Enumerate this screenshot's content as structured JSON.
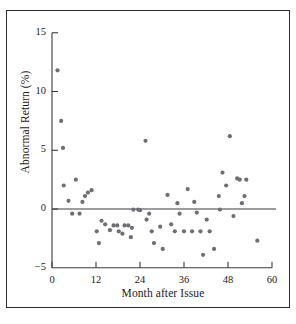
{
  "figure": {
    "axis_color": "#3a3a3a",
    "point_color": "#6e6e78",
    "frame_color": "#2a2a2a"
  },
  "chart_data": {
    "type": "scatter",
    "title": "",
    "xlabel": "Month after Issue",
    "ylabel": "Abnormal Return (%)",
    "xlim": [
      0,
      61
    ],
    "ylim": [
      -5,
      16
    ],
    "xticks": [
      0,
      12,
      24,
      36,
      48,
      60
    ],
    "xticklabels": [
      "0",
      "12",
      "24",
      "36",
      "48",
      "60"
    ],
    "yticks": [
      -5,
      0,
      5,
      10,
      15
    ],
    "yticklabels": [
      "−5",
      "0",
      "5",
      "10",
      "15"
    ],
    "grid": false,
    "legend": null,
    "zero_line": 0,
    "marker": "circle",
    "points": [
      [
        1.5,
        11.8
      ],
      [
        2.5,
        7.5
      ],
      [
        3.0,
        5.2
      ],
      [
        3.2,
        2.0
      ],
      [
        4.5,
        0.7
      ],
      [
        5.5,
        -0.4
      ],
      [
        6.5,
        2.5
      ],
      [
        7.5,
        -0.4
      ],
      [
        8.3,
        0.6
      ],
      [
        9.0,
        1.1
      ],
      [
        9.8,
        1.4
      ],
      [
        10.8,
        1.6
      ],
      [
        12.2,
        -1.9
      ],
      [
        12.8,
        -2.9
      ],
      [
        13.5,
        -1.0
      ],
      [
        14.5,
        -1.3
      ],
      [
        15.8,
        -1.8
      ],
      [
        16.8,
        -1.4
      ],
      [
        17.8,
        -1.4
      ],
      [
        18.2,
        -1.9
      ],
      [
        19.2,
        -2.1
      ],
      [
        19.8,
        -1.4
      ],
      [
        20.8,
        -1.4
      ],
      [
        21.5,
        -2.4
      ],
      [
        21.8,
        -1.6
      ],
      [
        22.2,
        -0.05
      ],
      [
        23.5,
        -0.05
      ],
      [
        24.0,
        -0.1
      ],
      [
        25.5,
        5.8
      ],
      [
        25.8,
        -0.9
      ],
      [
        26.5,
        -0.4
      ],
      [
        27.2,
        -1.9
      ],
      [
        27.8,
        -2.9
      ],
      [
        29.5,
        -1.5
      ],
      [
        30.2,
        -3.4
      ],
      [
        31.5,
        1.2
      ],
      [
        32.5,
        -1.3
      ],
      [
        33.5,
        -1.9
      ],
      [
        34.2,
        0.5
      ],
      [
        34.8,
        -0.4
      ],
      [
        36.0,
        -1.9
      ],
      [
        37.0,
        1.7
      ],
      [
        38.2,
        -1.9
      ],
      [
        38.8,
        0.6
      ],
      [
        39.5,
        -0.3
      ],
      [
        40.5,
        -1.9
      ],
      [
        41.2,
        -3.9
      ],
      [
        42.2,
        -0.9
      ],
      [
        43.0,
        -1.9
      ],
      [
        44.2,
        -3.4
      ],
      [
        45.5,
        1.1
      ],
      [
        45.8,
        -0.05
      ],
      [
        46.5,
        3.1
      ],
      [
        47.5,
        2.0
      ],
      [
        48.5,
        6.2
      ],
      [
        49.5,
        -0.6
      ],
      [
        50.5,
        2.6
      ],
      [
        51.2,
        2.5
      ],
      [
        51.8,
        0.5
      ],
      [
        52.5,
        1.1
      ],
      [
        53.0,
        2.5
      ],
      [
        56.0,
        -2.7
      ]
    ]
  }
}
